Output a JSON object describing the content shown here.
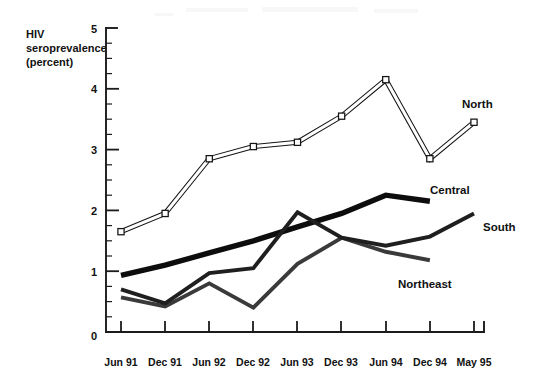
{
  "chart_data": {
    "type": "line",
    "title": "",
    "xlabel": "",
    "ylabel": "HIV seroprevalence (percent)",
    "ylabel_lines": [
      "HIV",
      "seroprevalence",
      "(percent)"
    ],
    "categories": [
      "Jun 91",
      "Dec 91",
      "Jun 92",
      "Dec 92",
      "Jun 93",
      "Dec 93",
      "Jun 94",
      "Dec 94",
      "May 95"
    ],
    "ylim": [
      0,
      5
    ],
    "ytick_labels": [
      "0",
      "1",
      "2",
      "3",
      "4",
      "5"
    ],
    "ytick_values": [
      0,
      1,
      2,
      3,
      4,
      5
    ],
    "yminor_step": 0.25,
    "grid": false,
    "legend_position": "inline-right",
    "series": [
      {
        "name": "North",
        "marker": "open-square",
        "style": "double-outline",
        "values": [
          1.65,
          1.95,
          2.85,
          3.05,
          3.12,
          3.55,
          4.15,
          2.85,
          3.45
        ]
      },
      {
        "name": "Central",
        "marker": "none",
        "style": "thick-solid",
        "values": [
          0.93,
          1.1,
          1.3,
          1.5,
          1.73,
          1.95,
          2.25,
          2.15,
          null
        ]
      },
      {
        "name": "South",
        "marker": "none",
        "style": "medium-solid",
        "values": [
          0.7,
          0.47,
          0.97,
          1.05,
          1.97,
          1.55,
          1.42,
          1.57,
          1.95
        ]
      },
      {
        "name": "Northeast",
        "marker": "none",
        "style": "medium-gray",
        "values": [
          0.57,
          0.42,
          0.8,
          0.4,
          1.12,
          1.55,
          1.32,
          1.18,
          null
        ]
      }
    ]
  },
  "labels": {
    "north": "North",
    "central": "Central",
    "south": "South",
    "northeast": "Northeast"
  },
  "axis": {
    "y_title_line1": "HIV",
    "y_title_line2": "seroprevalence",
    "y_title_line3": "(percent)"
  }
}
